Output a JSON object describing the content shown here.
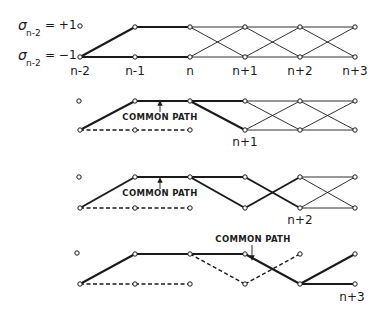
{
  "figure": {
    "colors": {
      "ink": "#1a1a1a",
      "background": "#ffffff"
    },
    "columns_x": [
      80,
      135,
      190,
      245,
      300,
      355
    ],
    "state_labels": [
      {
        "symbol": "σ",
        "subscript": "n-2",
        "eq": "= +1",
        "row": "top"
      },
      {
        "symbol": "σ",
        "subscript": "n-2",
        "eq": "= −1",
        "row": "bottom"
      }
    ],
    "time_labels": [
      "n-2",
      "n-1",
      "n",
      "n+1",
      "n+2",
      "n+3"
    ],
    "panels": [
      {
        "name": "panel-1",
        "top_y": 27,
        "bottom_y": 57,
        "isolated_node": [
          80,
          26
        ],
        "bold": [
          [
            80,
            57,
            135,
            27
          ],
          [
            135,
            27,
            190,
            27
          ],
          [
            80,
            57,
            135,
            57
          ],
          [
            135,
            57,
            190,
            57
          ]
        ],
        "dashed": [],
        "thin": [
          [
            190,
            27,
            245,
            27
          ],
          [
            190,
            27,
            245,
            57
          ],
          [
            190,
            57,
            245,
            57
          ],
          [
            190,
            57,
            245,
            27
          ],
          [
            245,
            27,
            300,
            27
          ],
          [
            245,
            27,
            300,
            57
          ],
          [
            245,
            57,
            300,
            57
          ],
          [
            245,
            57,
            300,
            27
          ],
          [
            300,
            27,
            355,
            27
          ],
          [
            300,
            27,
            355,
            57
          ],
          [
            300,
            57,
            355,
            57
          ],
          [
            300,
            57,
            355,
            27
          ]
        ],
        "nodes": [
          [
            80,
            57
          ],
          [
            135,
            27
          ],
          [
            135,
            57
          ],
          [
            190,
            27
          ],
          [
            190,
            57
          ],
          [
            245,
            27
          ],
          [
            245,
            57
          ],
          [
            300,
            27
          ],
          [
            300,
            57
          ],
          [
            355,
            27
          ],
          [
            355,
            57
          ]
        ],
        "time_label_y": 74,
        "common_path": null,
        "end_label": null
      },
      {
        "name": "panel-2",
        "top_y": 101,
        "bottom_y": 130,
        "isolated_node": [
          79,
          101
        ],
        "bold": [
          [
            80,
            130,
            135,
            101
          ],
          [
            135,
            101,
            190,
            101
          ],
          [
            190,
            101,
            245,
            101
          ],
          [
            190,
            101,
            245,
            130
          ]
        ],
        "dashed": [
          [
            80,
            130,
            135,
            130
          ],
          [
            135,
            130,
            190,
            130
          ]
        ],
        "thin": [
          [
            245,
            101,
            300,
            101
          ],
          [
            245,
            101,
            300,
            130
          ],
          [
            245,
            130,
            300,
            130
          ],
          [
            245,
            130,
            300,
            101
          ],
          [
            300,
            101,
            355,
            101
          ],
          [
            300,
            101,
            355,
            130
          ],
          [
            300,
            130,
            355,
            130
          ],
          [
            300,
            130,
            355,
            101
          ]
        ],
        "nodes": [
          [
            80,
            130
          ],
          [
            135,
            101
          ],
          [
            135,
            130
          ],
          [
            190,
            101
          ],
          [
            190,
            130
          ],
          [
            245,
            101
          ],
          [
            245,
            130
          ],
          [
            300,
            101
          ],
          [
            300,
            130
          ],
          [
            355,
            101
          ],
          [
            355,
            130
          ]
        ],
        "common_path": {
          "label": "COMMON PATH",
          "x": 160,
          "y": 120,
          "arrow": "up",
          "arrow_x": 160,
          "arrow_from": 112,
          "arrow_to": 103
        },
        "end_label": {
          "text": "n+1",
          "x": 245,
          "y": 146
        }
      },
      {
        "name": "panel-3",
        "top_y": 177,
        "bottom_y": 208,
        "isolated_node": [
          79,
          177
        ],
        "bold": [
          [
            80,
            208,
            135,
            177
          ],
          [
            135,
            177,
            190,
            177
          ],
          [
            190,
            177,
            245,
            177
          ],
          [
            190,
            177,
            245,
            208
          ],
          [
            245,
            177,
            300,
            208
          ],
          [
            245,
            208,
            300,
            177
          ]
        ],
        "dashed": [
          [
            80,
            208,
            135,
            208
          ],
          [
            135,
            208,
            190,
            208
          ]
        ],
        "thin": [
          [
            300,
            177,
            355,
            177
          ],
          [
            300,
            177,
            355,
            208
          ],
          [
            300,
            208,
            355,
            208
          ],
          [
            300,
            208,
            355,
            177
          ]
        ],
        "nodes": [
          [
            80,
            208
          ],
          [
            135,
            177
          ],
          [
            135,
            208
          ],
          [
            190,
            177
          ],
          [
            190,
            208
          ],
          [
            245,
            177
          ],
          [
            245,
            208
          ],
          [
            300,
            177
          ],
          [
            300,
            208
          ],
          [
            355,
            177
          ],
          [
            355,
            208
          ]
        ],
        "common_path": {
          "label": "COMMON PATH",
          "x": 160,
          "y": 196,
          "arrow": "up",
          "arrow_x": 160,
          "arrow_from": 189,
          "arrow_to": 180
        },
        "end_label": {
          "text": "n+2",
          "x": 300,
          "y": 224
        }
      },
      {
        "name": "panel-4",
        "top_y": 254,
        "bottom_y": 284,
        "isolated_node": [
          77,
          253
        ],
        "bold": [
          [
            80,
            284,
            135,
            254
          ],
          [
            135,
            254,
            190,
            254
          ],
          [
            190,
            254,
            245,
            254
          ],
          [
            245,
            254,
            300,
            284
          ],
          [
            300,
            284,
            355,
            254
          ],
          [
            300,
            284,
            355,
            284
          ]
        ],
        "dashed": [
          [
            80,
            284,
            135,
            284
          ],
          [
            135,
            284,
            190,
            284
          ],
          [
            190,
            254,
            245,
            284
          ],
          [
            245,
            284,
            300,
            254
          ]
        ],
        "thin": [],
        "nodes": [
          [
            80,
            284
          ],
          [
            135,
            254
          ],
          [
            135,
            284
          ],
          [
            190,
            254
          ],
          [
            190,
            284
          ],
          [
            245,
            254
          ],
          [
            245,
            284
          ],
          [
            300,
            254
          ],
          [
            300,
            284
          ],
          [
            355,
            254
          ],
          [
            355,
            284
          ]
        ],
        "common_path": {
          "label": "COMMON PATH",
          "x": 253,
          "y": 242,
          "arrow": "down",
          "arrow_x": 252,
          "arrow_from": 245,
          "arrow_to": 258
        },
        "end_label": {
          "text": "n+3",
          "x": 352,
          "y": 301
        }
      }
    ]
  }
}
